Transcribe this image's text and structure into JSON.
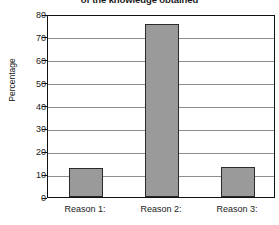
{
  "chart_data": {
    "type": "bar",
    "title": "of the knowledge obtained",
    "xlabel": "",
    "ylabel": "Percentage",
    "categories": [
      "Reason 1:",
      "Reason 2:",
      "Reason 3:"
    ],
    "values": [
      12.5,
      75.5,
      13
    ],
    "ylim": [
      0,
      80
    ],
    "ytick_labels": [
      "0",
      "10",
      "20",
      "30",
      "40",
      "50",
      "60",
      "70",
      "80"
    ],
    "ytick_values": [
      0,
      10,
      20,
      30,
      40,
      50,
      60,
      70,
      80
    ],
    "grid": true,
    "legend": false,
    "series": [
      {
        "name": "Percentage",
        "values": [
          12.5,
          75.5,
          13
        ],
        "color": "#9a9a9a",
        "edge_color": "#2a2a2a"
      }
    ]
  },
  "colors": {
    "bar_fill": "#9a9a9a",
    "bar_edge": "#2a2a2a",
    "grid": "#8e8e8e",
    "frame": "#111111",
    "text": "#1a1a1a",
    "background": "#ffffff"
  }
}
